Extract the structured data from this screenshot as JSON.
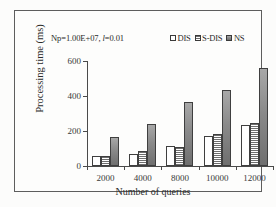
{
  "annotation": {
    "prefix": "Np=1.00E+07, ",
    "italic_var": "l",
    "suffix": "=0.01"
  },
  "chart_data": {
    "type": "bar",
    "title": "",
    "subtitle": "",
    "xlabel": "Number of queries",
    "ylabel": "Processing time (ms)",
    "categories": [
      "2000",
      "4000",
      "8000",
      "10000",
      "12000"
    ],
    "series": [
      {
        "name": "DIS",
        "values": [
          55,
          70,
          115,
          172,
          232
        ]
      },
      {
        "name": "S-DIS",
        "values": [
          55,
          88,
          110,
          185,
          245
        ]
      },
      {
        "name": "NS",
        "values": [
          163,
          242,
          368,
          432,
          558
        ]
      }
    ],
    "ylim": [
      0,
      600
    ],
    "yticks": [
      0,
      200,
      400,
      600
    ],
    "ytick_labels": [
      "0",
      "200",
      "400",
      "600"
    ],
    "grid": false,
    "legend_position": "top-right",
    "legend_entries": [
      "DIS",
      "S-DIS",
      "NS"
    ],
    "annotation_text": "Np=1.00E+07, l=0.01",
    "colors": {
      "DIS": "#ffffff",
      "S-DIS": "#ffffff",
      "NS": "#8f8f8f",
      "outline": "#3f3f3f",
      "axis": "#4a4a4a",
      "text": "#2b2b2b",
      "background": "#fdfdfc"
    },
    "series_fill_styles": [
      "solid-white",
      "horizontal-hatch",
      "gray-solid"
    ]
  }
}
